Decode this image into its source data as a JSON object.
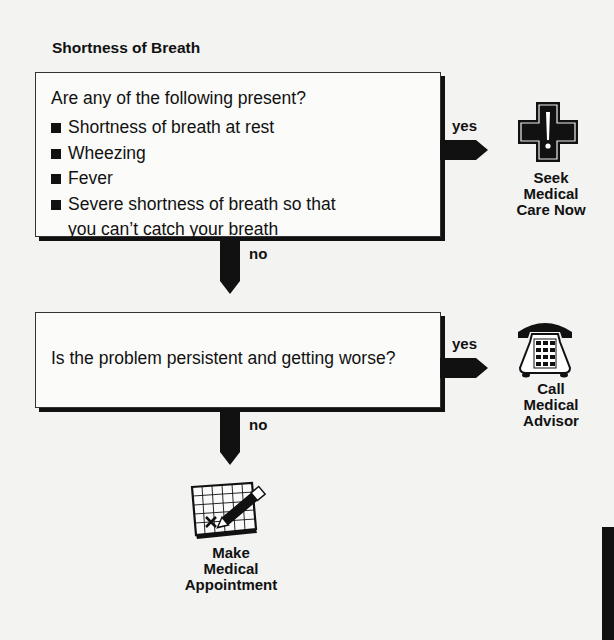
{
  "title": "Shortness of Breath",
  "colors": {
    "ink": "#111111",
    "paper": "#f3f3f1",
    "box": "#fbfbf9"
  },
  "question1": {
    "prompt": "Are any of the following present?",
    "items": [
      "Shortness of breath at rest",
      "Wheezing",
      "Fever",
      "Severe shortness of breath so that you can’t catch your breath"
    ],
    "yes_label": "yes",
    "no_label": "no"
  },
  "outcome1": {
    "lines": [
      "Seek",
      "Medical",
      "Care Now"
    ],
    "icon": "medical-cross-icon"
  },
  "question2": {
    "prompt": "Is the problem persistent and getting worse?",
    "yes_label": "yes",
    "no_label": "no"
  },
  "outcome2": {
    "lines": [
      "Call",
      "Medical",
      "Advisor"
    ],
    "icon": "telephone-icon"
  },
  "outcome3": {
    "lines": [
      "Make",
      "Medical",
      "Appointment"
    ],
    "icon": "calendar-pencil-icon"
  }
}
